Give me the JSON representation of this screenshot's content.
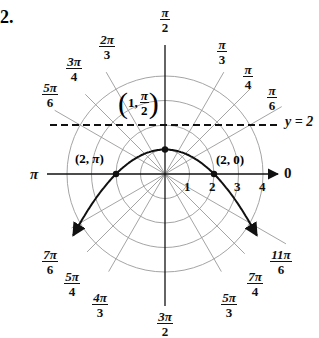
{
  "problem_number": "2.",
  "chart_data": {
    "type": "line",
    "title": "",
    "equation_cartesian": "y = 1 - x^2/4",
    "polar_grid": {
      "circle_radii": [
        1,
        2,
        3,
        4
      ],
      "radius_tick_labels": [
        "1",
        "2",
        "3",
        "4"
      ],
      "angle_labels": [
        {
          "angle_deg": 0,
          "num": "0",
          "den": ""
        },
        {
          "angle_deg": 30,
          "num": "π",
          "den": "6"
        },
        {
          "angle_deg": 45,
          "num": "π",
          "den": "4"
        },
        {
          "angle_deg": 60,
          "num": "π",
          "den": "3"
        },
        {
          "angle_deg": 90,
          "num": "π",
          "den": "2"
        },
        {
          "angle_deg": 120,
          "num": "2π",
          "den": "3"
        },
        {
          "angle_deg": 135,
          "num": "3π",
          "den": "4"
        },
        {
          "angle_deg": 150,
          "num": "5π",
          "den": "6"
        },
        {
          "angle_deg": 180,
          "num": "π",
          "den": ""
        },
        {
          "angle_deg": 210,
          "num": "7π",
          "den": "6"
        },
        {
          "angle_deg": 225,
          "num": "5π",
          "den": "4"
        },
        {
          "angle_deg": 240,
          "num": "4π",
          "den": "3"
        },
        {
          "angle_deg": 270,
          "num": "3π",
          "den": "2"
        },
        {
          "angle_deg": 300,
          "num": "5π",
          "den": "3"
        },
        {
          "angle_deg": 315,
          "num": "7π",
          "den": "4"
        },
        {
          "angle_deg": 330,
          "num": "11π",
          "den": "6"
        }
      ]
    },
    "directrix": {
      "label": "y = 2",
      "y": 2,
      "style": "dashed"
    },
    "points": [
      {
        "label": "(2, 0)",
        "r": 2,
        "theta": "0",
        "x": 2,
        "y": 0
      },
      {
        "label": "(1, π/2)",
        "r": 1,
        "theta": "π/2",
        "x": 0,
        "y": 1
      },
      {
        "label": "(2, π)",
        "r": 2,
        "theta": "π",
        "x": -2,
        "y": 0
      }
    ],
    "series": [
      {
        "name": "parabola",
        "x": [
          -3.7,
          -3,
          -2,
          -1,
          0,
          1,
          2,
          3,
          3.7
        ],
        "y": [
          -2.42,
          -1.25,
          0,
          0.75,
          1,
          0.75,
          0,
          -1.25,
          -2.42
        ]
      }
    ],
    "xlim": [
      -4,
      4
    ],
    "ylim": [
      -4,
      4
    ]
  },
  "labels": {
    "axis_zero": "0",
    "axis_pi": "π",
    "directrix": "y = 2",
    "point_2_0": "(2, 0)",
    "point_2_pi_pre": "(2, ",
    "point_2_pi_sym": "π",
    "point_2_pi_post": ")",
    "point_1_pre": "1,",
    "point_1_num": "π",
    "point_1_den": "2",
    "r1": "1",
    "r2": "2",
    "r3": "3",
    "r4": "4"
  }
}
